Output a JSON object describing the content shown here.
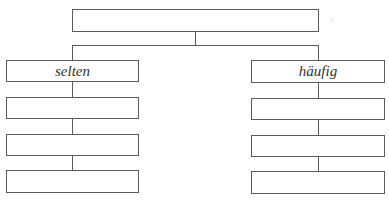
{
  "diagram": {
    "type": "tree",
    "root": {
      "label": ""
    },
    "branches": [
      {
        "label": "selten",
        "children": [
          {
            "label": ""
          },
          {
            "label": ""
          },
          {
            "label": ""
          }
        ]
      },
      {
        "label": "häufig",
        "children": [
          {
            "label": ""
          },
          {
            "label": ""
          },
          {
            "label": ""
          }
        ]
      }
    ],
    "colors": {
      "stroke": "#5a5a5a",
      "text": "#333333",
      "background": "#ffffff"
    }
  }
}
